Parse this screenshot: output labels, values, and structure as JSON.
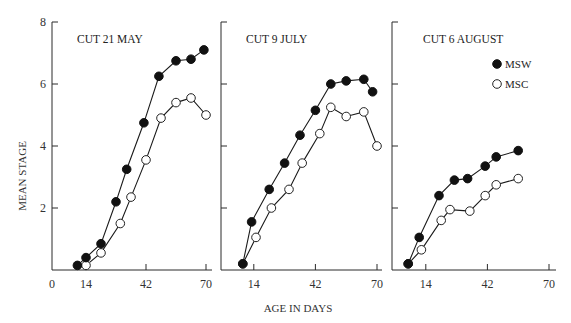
{
  "chart_data": {
    "type": "line",
    "ylabel": "MEAN STAGE",
    "xlabel": "AGE IN DAYS",
    "ylim": [
      0,
      8
    ],
    "yticks": [
      2,
      4,
      6,
      8
    ],
    "xticks": [
      14,
      42,
      70
    ],
    "x_origin_label": "0",
    "grid": false,
    "legend": {
      "position": "upper right of third panel",
      "entries": [
        {
          "name": "MSW",
          "marker": "filled-circle"
        },
        {
          "name": "MSC",
          "marker": "open-circle"
        }
      ]
    },
    "panels": [
      {
        "title": "CUT 21 MAY",
        "series": [
          {
            "name": "MSW",
            "x": [
              10,
              14,
              21,
              28,
              33,
              41,
              48,
              56,
              63,
              69
            ],
            "values": [
              0.15,
              0.4,
              0.85,
              2.2,
              3.25,
              4.75,
              6.25,
              6.75,
              6.8,
              7.1
            ]
          },
          {
            "name": "MSC",
            "x": [
              14,
              21,
              30,
              35,
              42,
              49,
              56,
              63,
              70
            ],
            "values": [
              0.15,
              0.55,
              1.5,
              2.35,
              3.55,
              4.9,
              5.4,
              5.55,
              5.0
            ]
          }
        ]
      },
      {
        "title": "CUT 9 JULY",
        "series": [
          {
            "name": "MSW",
            "x": [
              9,
              13,
              21,
              28,
              35,
              42,
              49,
              56,
              64,
              68
            ],
            "values": [
              0.2,
              1.55,
              2.6,
              3.45,
              4.35,
              5.15,
              6.0,
              6.1,
              6.15,
              5.75
            ]
          },
          {
            "name": "MSC",
            "x": [
              9,
              15,
              22,
              30,
              36,
              44,
              49,
              56,
              64,
              70
            ],
            "values": [
              0.2,
              1.05,
              2.0,
              2.6,
              3.45,
              4.4,
              5.25,
              4.95,
              5.1,
              4.0
            ]
          }
        ]
      },
      {
        "title": "CUT 6 AUGUST",
        "series": [
          {
            "name": "MSW",
            "x": [
              6,
              11,
              20,
              27,
              33,
              41,
              46,
              56
            ],
            "values": [
              0.2,
              1.05,
              2.4,
              2.9,
              2.95,
              3.35,
              3.65,
              3.85
            ]
          },
          {
            "name": "MSC",
            "x": [
              6,
              12,
              21,
              25,
              34,
              41,
              46,
              56
            ],
            "values": [
              0.2,
              0.65,
              1.6,
              1.95,
              1.9,
              2.4,
              2.75,
              2.95
            ]
          }
        ]
      }
    ]
  },
  "layout_hint": {
    "panels_px": [
      {
        "yaxis_x": 52,
        "day0_x": 56,
        "px_per_day": 2.143,
        "axis_end_x": 212
      },
      {
        "yaxis_x": 221,
        "day0_x": 223,
        "px_per_day": 2.2,
        "axis_end_x": 382
      },
      {
        "yaxis_x": 392,
        "day0_x": 395,
        "px_per_day": 2.2,
        "axis_end_x": 556
      }
    ],
    "baseline_y": 270,
    "px_per_unit": 31
  }
}
